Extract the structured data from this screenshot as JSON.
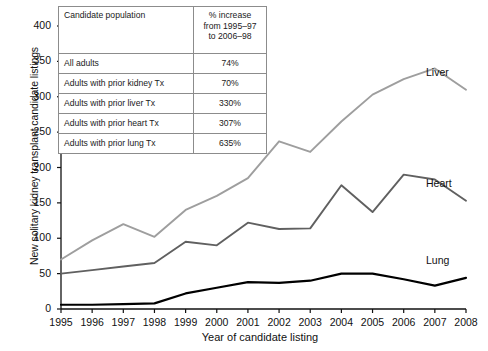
{
  "chart_data": {
    "type": "line",
    "title": "",
    "xlabel": "Year of candidate listing",
    "ylabel": "New solitary kidney transplant candidate listings",
    "x": [
      1995,
      1996,
      1997,
      1998,
      1999,
      2000,
      2001,
      2002,
      2003,
      2004,
      2005,
      2006,
      2007,
      2008
    ],
    "xtick_labels": [
      "1995",
      "1996",
      "1997",
      "1998",
      "1999",
      "2000",
      "2001",
      "2002",
      "2003",
      "2004",
      "2005",
      "2006",
      "2007",
      "2008"
    ],
    "ytick_labels": [
      "0",
      "50",
      "100",
      "150",
      "200",
      "250",
      "300",
      "350",
      "400"
    ],
    "yticks": [
      0,
      50,
      100,
      150,
      200,
      250,
      300,
      350,
      400
    ],
    "ylim": [
      0,
      400
    ],
    "xlim": [
      1995,
      2008
    ],
    "grid": false,
    "legend_position": "inline-right-of-line-ends",
    "series": [
      {
        "name": "Liver",
        "color": "#9e9e9e",
        "values": [
          70,
          97,
          120,
          102,
          140,
          160,
          185,
          237,
          222,
          265,
          303,
          325,
          340,
          310
        ]
      },
      {
        "name": "Heart",
        "color": "#606060",
        "values": [
          50,
          55,
          60,
          65,
          95,
          90,
          122,
          113,
          114,
          175,
          137,
          190,
          183,
          153
        ]
      },
      {
        "name": "Lung",
        "color": "#000000",
        "values": [
          6,
          6,
          7,
          8,
          22,
          30,
          38,
          37,
          40,
          50,
          50,
          42,
          33,
          44
        ]
      }
    ]
  },
  "inset_table": {
    "headers": [
      "Candidate population",
      "% increase from 1995–97 to 2006–98"
    ],
    "header_pct_lines": [
      "% increase",
      "from 1995–97",
      "to 2006–98"
    ],
    "rows": [
      {
        "population": "All adults",
        "increase": "74%"
      },
      {
        "population": "Adults with prior kidney Tx",
        "increase": "70%"
      },
      {
        "population": "Adults with prior liver Tx",
        "increase": "330%"
      },
      {
        "population": "Adults with prior heart Tx",
        "increase": "307%"
      },
      {
        "population": "Adults with prior lung Tx",
        "increase": "635%"
      }
    ]
  },
  "axis_color": "#111111",
  "background": "#ffffff"
}
